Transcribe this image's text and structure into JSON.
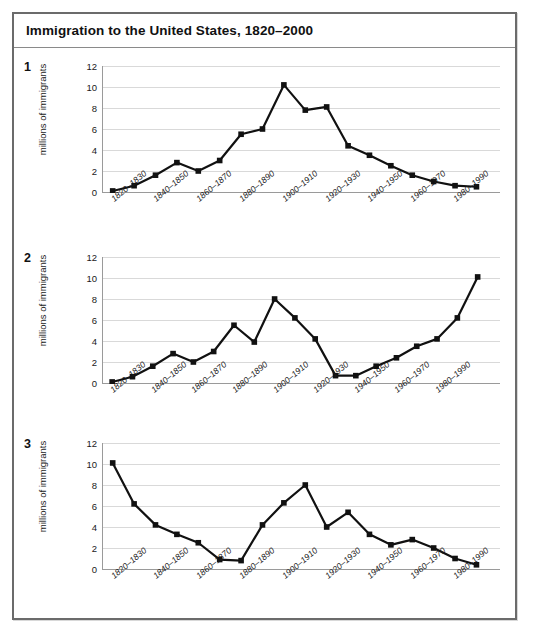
{
  "document": {
    "title": "Immigration to the United States, 1820–2000"
  },
  "charts": [
    {
      "number": "1",
      "ylabel": "millions of immigrants"
    },
    {
      "number": "2",
      "ylabel": "millions of immigrants"
    },
    {
      "number": "3",
      "ylabel": "millions of immigrants"
    }
  ],
  "axis": {
    "yticks": [
      "0",
      "2",
      "4",
      "6",
      "8",
      "10",
      "12"
    ],
    "xlabels": [
      "1820–1830",
      "1840–1850",
      "1860–1870",
      "1880–1890",
      "1900–1910",
      "1920–1930",
      "1940–1950",
      "1960–1970",
      "1980–1990"
    ]
  },
  "colors": {
    "frame_border": "#6b6b6b",
    "grid": "#d9d9d9",
    "axis": "#9a9a9a",
    "series_line": "#111111",
    "marker": "#111111",
    "text": "#1a1a1a",
    "background": "#ffffff"
  },
  "chart_data": [
    {
      "type": "line",
      "title": "1",
      "xlabel": "",
      "ylabel": "millions of immigrants",
      "ylim": [
        0,
        12
      ],
      "grid": true,
      "legend": "none",
      "categories": [
        "1820–1830",
        "1830–1840",
        "1840–1850",
        "1850–1860",
        "1860–1870",
        "1870–1880",
        "1880–1890",
        "1890–1900",
        "1900–1910",
        "1910–1920",
        "1920–1930",
        "1930–1940",
        "1940–1950",
        "1950–1960",
        "1960–1970",
        "1970–1980",
        "1980–1990",
        "1990–2000"
      ],
      "values": [
        0.1,
        0.6,
        1.6,
        2.8,
        2.0,
        3.0,
        5.5,
        6.0,
        10.2,
        7.8,
        8.1,
        4.4,
        3.5,
        2.5,
        1.6,
        1.0,
        0.6,
        0.5
      ]
    },
    {
      "type": "line",
      "title": "2",
      "xlabel": "",
      "ylabel": "millions of immigrants",
      "ylim": [
        0,
        12
      ],
      "grid": true,
      "legend": "none",
      "categories": [
        "1820–1830",
        "1830–1840",
        "1840–1850",
        "1850–1860",
        "1860–1870",
        "1870–1880",
        "1880–1890",
        "1890–1900",
        "1900–1910",
        "1910–1920",
        "1920–1930",
        "1930–1940",
        "1940–1950",
        "1950–1960",
        "1960–1970",
        "1970–1980",
        "1980–1990",
        "1990–2000"
      ],
      "values": [
        0.1,
        0.6,
        1.6,
        2.8,
        2.0,
        3.0,
        5.5,
        3.9,
        8.0,
        6.2,
        4.2,
        0.7,
        0.7,
        1.6,
        2.4,
        3.5,
        4.2,
        6.2,
        10.1
      ]
    },
    {
      "type": "line",
      "title": "3",
      "xlabel": "",
      "ylabel": "millions of immigrants",
      "ylim": [
        0,
        12
      ],
      "grid": true,
      "legend": "none",
      "categories": [
        "1820–1830",
        "1830–1840",
        "1840–1850",
        "1850–1860",
        "1860–1870",
        "1870–1880",
        "1880–1890",
        "1890–1900",
        "1900–1910",
        "1910–1920",
        "1920–1930",
        "1930–1940",
        "1940–1950",
        "1950–1960",
        "1960–1970",
        "1970–1980",
        "1980–1990",
        "1990–2000"
      ],
      "values": [
        10.1,
        6.2,
        4.2,
        3.3,
        2.5,
        0.9,
        0.8,
        4.2,
        6.3,
        8.0,
        4.0,
        5.4,
        3.3,
        2.3,
        2.8,
        2.0,
        1.0,
        0.4
      ]
    }
  ]
}
